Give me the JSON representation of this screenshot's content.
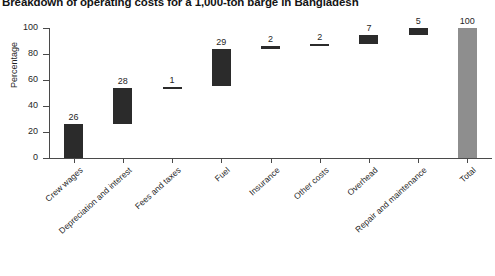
{
  "chart_data": {
    "type": "bar",
    "subtype": "waterfall",
    "title": "Breakdown of operating costs for a 1,000-ton barge in Bangladesh",
    "xlabel": "",
    "ylabel": "Percentage",
    "ylim": [
      0,
      100
    ],
    "ytick_labels": [
      "0",
      "20",
      "40",
      "60",
      "80",
      "100"
    ],
    "ytick_values": [
      0,
      20,
      40,
      60,
      80,
      100
    ],
    "grid": false,
    "legend": false,
    "categories": [
      "Crew wages",
      "Depreciation and interest",
      "Fees and taxes",
      "Fuel",
      "Insurance",
      "Other costs",
      "Overhead",
      "Repair and maintenance",
      "Total"
    ],
    "values": [
      26,
      28,
      1,
      29,
      2,
      2,
      7,
      5,
      100
    ],
    "value_labels": [
      "26",
      "28",
      "1",
      "29",
      "2",
      "2",
      "7",
      "5",
      "100"
    ],
    "bars": [
      {
        "label": "Crew wages",
        "value": 26,
        "base": 0,
        "top": 26,
        "kind": "increment"
      },
      {
        "label": "Depreciation and interest",
        "value": 28,
        "base": 26,
        "top": 54,
        "kind": "increment"
      },
      {
        "label": "Fees and taxes",
        "value": 1,
        "base": 54,
        "top": 55,
        "kind": "increment"
      },
      {
        "label": "Fuel",
        "value": 29,
        "base": 55,
        "top": 84,
        "kind": "increment"
      },
      {
        "label": "Insurance",
        "value": 2,
        "base": 84,
        "top": 86,
        "kind": "increment"
      },
      {
        "label": "Other costs",
        "value": 2,
        "base": 86,
        "top": 88,
        "kind": "increment"
      },
      {
        "label": "Overhead",
        "value": 7,
        "base": 88,
        "top": 95,
        "kind": "increment"
      },
      {
        "label": "Repair and maintenance",
        "value": 5,
        "base": 95,
        "top": 100,
        "kind": "increment"
      },
      {
        "label": "Total",
        "value": 100,
        "base": 0,
        "top": 100,
        "kind": "total"
      }
    ],
    "colors": {
      "increment": "#2b2b2b",
      "total": "#8e8e8e",
      "axis": "#4a4a4a",
      "text": "#1f1f1f",
      "background": "#ffffff"
    }
  }
}
